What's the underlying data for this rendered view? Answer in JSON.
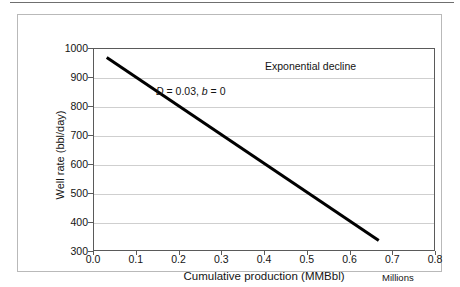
{
  "figure": {
    "background_color": "#ffffff",
    "frame_color": "#b9b9b9",
    "plot_border_color": "#5a5a5a",
    "gridline_color": "#cfcfcf",
    "series_color": "#000000"
  },
  "chart_data": {
    "type": "line",
    "title": "",
    "annotations": [
      {
        "text": "Exponential decline",
        "x": 0.4,
        "y": 940
      },
      {
        "text": "D = 0.03, b = 0",
        "x": 0.145,
        "y": 855,
        "italic_tokens": [
          "D",
          "b"
        ]
      }
    ],
    "xlabel": "Cumulative production (MMBbl)",
    "ylabel": "Well rate (bbl/day)",
    "x_units_note": "Millions",
    "xlim": [
      0.0,
      0.8
    ],
    "ylim": [
      300,
      1000
    ],
    "xticks": [
      0.0,
      0.1,
      0.2,
      0.3,
      0.4,
      0.5,
      0.6,
      0.7,
      0.8
    ],
    "xtick_labels": [
      "0.0",
      "0.1",
      "0.2",
      "0.3",
      "0.4",
      "0.5",
      "0.6",
      "0.7",
      "0.8"
    ],
    "yticks": [
      300,
      400,
      500,
      600,
      700,
      800,
      900,
      1000
    ],
    "ytick_labels": [
      "300",
      "400",
      "500",
      "600",
      "700",
      "800",
      "900",
      "1000"
    ],
    "grid": {
      "horizontal": true,
      "vertical": false
    },
    "legend": null,
    "series": [
      {
        "name": "Exponential decline",
        "color": "#000000",
        "linewidth": 3,
        "x": [
          0.03,
          0.67
        ],
        "y": [
          970,
          333
        ]
      }
    ]
  },
  "labels": {
    "annotation_title": "Exponential decline",
    "annotation_params_prefix": "D",
    "annotation_params_mid": " = 0.03, ",
    "annotation_params_b": "b",
    "annotation_params_suffix": " = 0",
    "x_axis_title": "Cumulative production (MMBbl)",
    "x_units": "Millions",
    "y_axis_title": "Well rate (bbl/day)"
  }
}
